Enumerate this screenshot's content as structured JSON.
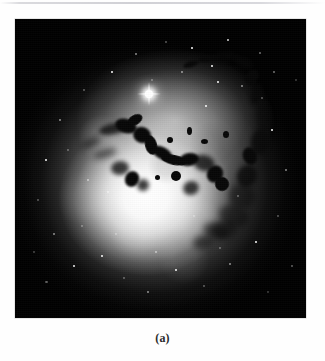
{
  "figure": {
    "caption": "(a)",
    "media_type": "grayscale-astronomical-photograph",
    "frame": {
      "x": 15,
      "y": 19,
      "width": 291,
      "height": 299,
      "background_color": "#000000",
      "border_color": "#cfcfcf"
    },
    "page_background_color": "#ffffff",
    "artifacts": {
      "top_scan_line_color": "#d0d0d5"
    }
  },
  "image_features": {
    "galaxy_core": {
      "label": "bright galaxy nucleus",
      "center_x_pct": 45,
      "center_y_pct": 60,
      "peak_color": "#ffffff"
    },
    "halo": {
      "label": "diffuse elliptical halo",
      "center_x_pct": 48,
      "center_y_pct": 55,
      "falloff_color": "#000000"
    },
    "foreground_star": {
      "label": "bright foreground star with diffraction spikes",
      "x": 134,
      "y": 75,
      "color": "#ffffff"
    },
    "dust_lanes": {
      "label": "dark obscuring dust filaments",
      "color": "#070707",
      "region": "central band running upper-left to right, plus arcs on the right flank"
    },
    "starfield": {
      "label": "background stars",
      "color": "#ffffff",
      "count_visible": 46
    }
  }
}
